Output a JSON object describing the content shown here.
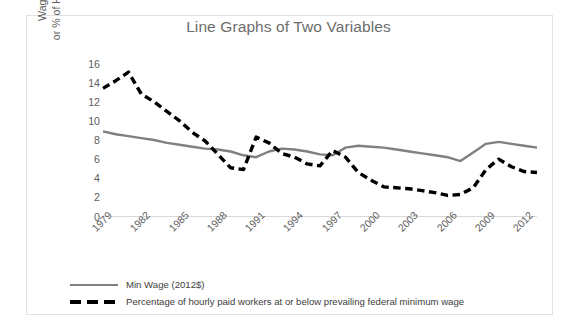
{
  "chart_data": {
    "type": "line",
    "title": "Line Graphs of Two Variables",
    "xlabel": "",
    "ylabel": "Wage in 2012$\nor % of Hourly Workers",
    "ylim": [
      0,
      16
    ],
    "yticks": [
      0,
      2,
      4,
      6,
      8,
      10,
      12,
      14,
      16
    ],
    "xticks": [
      "1979",
      "1982",
      "1985",
      "1988",
      "1991",
      "1994",
      "1997",
      "2000",
      "2003",
      "2006",
      "2009",
      "2012"
    ],
    "grid": false,
    "legend_position": "bottom-left",
    "x": [
      1979,
      1980,
      1981,
      1982,
      1983,
      1984,
      1985,
      1986,
      1987,
      1988,
      1989,
      1990,
      1991,
      1992,
      1993,
      1994,
      1995,
      1996,
      1997,
      1998,
      1999,
      2000,
      2001,
      2002,
      2003,
      2004,
      2005,
      2006,
      2007,
      2008,
      2009,
      2010,
      2011,
      2012,
      2013
    ],
    "series": [
      {
        "name": "Min Wage (2012$)",
        "style": "solid",
        "color": "#808080",
        "values": [
          8.9,
          8.6,
          8.4,
          8.2,
          8.0,
          7.7,
          7.5,
          7.3,
          7.1,
          7.0,
          6.8,
          6.4,
          6.2,
          6.8,
          7.1,
          7.0,
          6.8,
          6.5,
          6.4,
          7.2,
          7.4,
          7.3,
          7.2,
          7.0,
          6.8,
          6.6,
          6.4,
          6.2,
          5.8,
          6.7,
          7.6,
          7.8,
          7.6,
          7.4,
          7.2
        ]
      },
      {
        "name": "Percentage of hourly paid workers at or below prevailing federal minimum wage",
        "style": "dashed",
        "color": "#000000",
        "values": [
          13.4,
          14.2,
          15.1,
          12.8,
          12.0,
          11.0,
          10.0,
          8.8,
          7.9,
          6.5,
          5.1,
          4.9,
          8.3,
          7.7,
          6.6,
          6.2,
          5.5,
          5.3,
          6.9,
          6.2,
          4.6,
          3.8,
          3.1,
          3.0,
          2.9,
          2.7,
          2.5,
          2.2,
          2.3,
          3.0,
          4.9,
          6.0,
          5.2,
          4.7,
          4.6
        ]
      }
    ]
  },
  "legend": {
    "items": [
      {
        "label": "Min Wage (2012$)",
        "style": "solid"
      },
      {
        "label": "Percentage of hourly paid workers at or below prevailing federal minimum wage",
        "style": "dashed"
      }
    ]
  }
}
